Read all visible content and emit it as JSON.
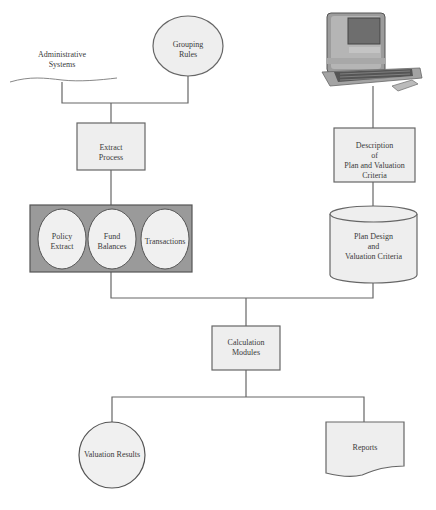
{
  "diagram": {
    "type": "flowchart",
    "colors": {
      "line": "#666666",
      "box_fill": "#eeeeee",
      "container_fill": "#9a9a9a",
      "circle_fill": "#f0f0f0"
    },
    "nodes": {
      "administrative_systems": {
        "line1": "Administrative",
        "line2": "Systems",
        "shape": "wavy-line"
      },
      "grouping_rules": {
        "line1": "Grouping",
        "line2": "Rules",
        "shape": "ellipse"
      },
      "extract_process": {
        "line1": "Extract",
        "line2": "Process",
        "shape": "rectangle"
      },
      "policy_extract": {
        "line1": "Policy",
        "line2": "Extract",
        "shape": "circle"
      },
      "fund_balances": {
        "line1": "Fund",
        "line2": "Balances",
        "shape": "circle"
      },
      "transactions": {
        "line1": "Transactions",
        "shape": "circle"
      },
      "computer": {
        "shape": "computer-image"
      },
      "description": {
        "line1": "Description",
        "line2": "of",
        "line3": "Plan and Valuation Criteria",
        "shape": "rectangle"
      },
      "plan_design": {
        "line1": "Plan Design",
        "line2": "and",
        "line3": "Valuation Criteria",
        "shape": "cylinder"
      },
      "calculation_modules": {
        "line1": "Calculation",
        "line2": "Modules",
        "shape": "rectangle"
      },
      "valuation_results": {
        "line1": "Valuation Results",
        "shape": "circle"
      },
      "reports": {
        "line1": "Reports",
        "shape": "document"
      }
    },
    "edges": [
      [
        "administrative_systems",
        "extract_process"
      ],
      [
        "grouping_rules",
        "extract_process"
      ],
      [
        "extract_process",
        "extract_group"
      ],
      [
        "computer",
        "description"
      ],
      [
        "description",
        "plan_design"
      ],
      [
        "extract_group",
        "calculation_modules"
      ],
      [
        "plan_design",
        "calculation_modules"
      ],
      [
        "calculation_modules",
        "valuation_results"
      ],
      [
        "calculation_modules",
        "reports"
      ]
    ]
  }
}
